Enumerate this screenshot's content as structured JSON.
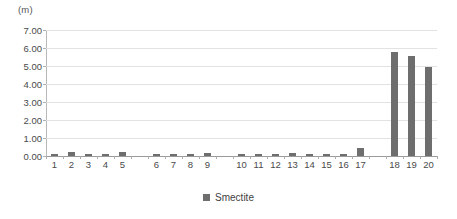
{
  "chart_data": {
    "type": "bar",
    "title": "",
    "subtitle": "",
    "xlabel": "",
    "ylabel": "",
    "unit_label": "(m)",
    "ylim": [
      0,
      7
    ],
    "ytick_step": 1,
    "ytick_labels": [
      "0.00",
      "1.00",
      "2.00",
      "3.00",
      "4.00",
      "5.00",
      "6.00",
      "7.00"
    ],
    "grid": "horizontal",
    "legend_position": "bottom-center",
    "legend": [
      {
        "name": "Smectite",
        "color": "#6E6E6E"
      }
    ],
    "categories": [
      "1",
      "2",
      "3",
      "4",
      "5",
      "6",
      "7",
      "8",
      "9",
      "10",
      "11",
      "12",
      "13",
      "14",
      "15",
      "16",
      "17",
      "18",
      "19",
      "20"
    ],
    "group_gaps_after": [
      "5",
      "9",
      "17"
    ],
    "series": [
      {
        "name": "Smectite",
        "color": "#6E6E6E",
        "values": [
          0.1,
          0.2,
          0.08,
          0.08,
          0.22,
          0.08,
          0.13,
          0.12,
          0.16,
          0.13,
          0.12,
          0.13,
          0.16,
          0.12,
          0.1,
          0.09,
          0.45,
          5.8,
          5.55,
          4.95
        ]
      }
    ]
  },
  "colors": {
    "bar": "#6E6E6E",
    "gridline": "#E2E2E2",
    "axis": "#9A9A9A",
    "text": "#4A4A4A",
    "background": "#FFFFFF"
  }
}
